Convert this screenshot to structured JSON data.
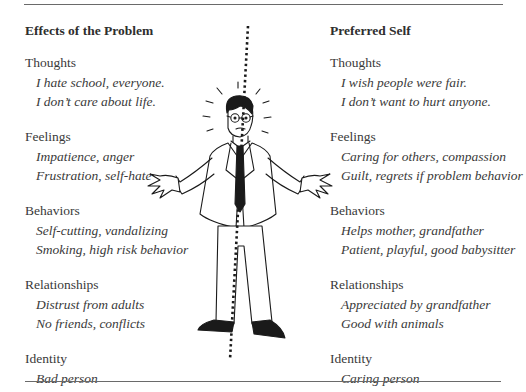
{
  "figure": {
    "left_column": {
      "title": "Effects of the Problem",
      "sections": [
        {
          "label": "Thoughts",
          "items": [
            "I hate school, everyone.",
            "I don’t care about life."
          ]
        },
        {
          "label": "Feelings",
          "items": [
            "Impatience, anger",
            "Frustration, self-hate"
          ]
        },
        {
          "label": "Behaviors",
          "items": [
            "Self-cutting, vandalizing",
            "Smoking, high risk behavior"
          ]
        },
        {
          "label": "Relationships",
          "items": [
            "Distrust from adults",
            "No friends, conflicts"
          ]
        },
        {
          "label": "Identity",
          "items": [
            "Bad person"
          ]
        }
      ]
    },
    "right_column": {
      "title": "Preferred Self",
      "sections": [
        {
          "label": "Thoughts",
          "items": [
            "I wish people were fair.",
            "I don’t want to hurt anyone."
          ]
        },
        {
          "label": "Feelings",
          "items": [
            "Caring for others, compassion",
            "Guilt, regrets if problem behavior"
          ]
        },
        {
          "label": "Behaviors",
          "items": [
            "Helps mother, grandfather",
            "Patient, playful, good babysitter"
          ]
        },
        {
          "label": "Relationships",
          "items": [
            "Appreciated by grandfather",
            "Good with animals"
          ]
        },
        {
          "label": "Identity",
          "items": [
            "Caring person"
          ]
        }
      ]
    },
    "illustration": {
      "subject": "stressed man in suit shrugging, split by dotted line",
      "divider_style": "dotted",
      "colors": {
        "line": "#1a1a1a",
        "tie": "#1a1a1a",
        "shoes": "#1a1a1a",
        "rule": "#6a6a6a"
      }
    }
  }
}
